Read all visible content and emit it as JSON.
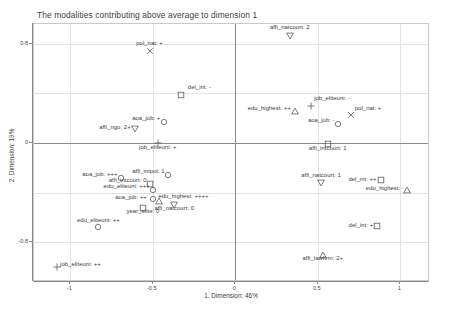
{
  "chart_data": {
    "type": "scatter",
    "title": "The modalities contributing above average to dimension 1",
    "xlabel": "1. Dimension: 46%",
    "ylabel": "2. Dimension: 19%",
    "xlim": [
      -1.22,
      1.18
    ],
    "ylim": [
      -1.12,
      0.96
    ],
    "xticks": [
      -1,
      -0.5,
      0,
      0.5,
      1
    ],
    "xticklabels": [
      "-1",
      "-0.5",
      "0",
      "0.5",
      "1"
    ],
    "yticks": [
      0.8,
      0,
      -0.8
    ],
    "yticklabels": [
      "0.8",
      "0",
      "-0.8"
    ],
    "grid": true,
    "legend": "none",
    "origin_axes": true,
    "points": [
      {
        "label": "affi_natcourt: 2",
        "x": 0.33,
        "y": 0.86,
        "marker": "triangle-down",
        "lx": 0,
        "ly": -6,
        "anchor": "center"
      },
      {
        "label": "pol_nat: +",
        "x": -0.52,
        "y": 0.74,
        "marker": "x",
        "lx": 0,
        "ly": -5,
        "anchor": "center"
      },
      {
        "label": "del_int: -",
        "x": -0.33,
        "y": 0.39,
        "marker": "square",
        "lx": 7,
        "ly": -5,
        "anchor": "start"
      },
      {
        "label": "job_eliteuni: -",
        "x": 0.46,
        "y": 0.3,
        "marker": "plus",
        "lx": 3,
        "ly": -5,
        "anchor": "start"
      },
      {
        "label": "edu_highest: ++",
        "x": 0.36,
        "y": 0.26,
        "marker": "triangle-up",
        "lx": -4,
        "ly": 0,
        "anchor": "end"
      },
      {
        "label": "pol_nat: +",
        "x": 0.7,
        "y": 0.23,
        "marker": "x",
        "lx": 4,
        "ly": -4,
        "anchor": "start"
      },
      {
        "label": "aoa_job: -",
        "x": 0.62,
        "y": 0.15,
        "marker": "circle",
        "lx": -3,
        "ly": -1,
        "anchor": "end"
      },
      {
        "label": "aoa_job: +",
        "x": -0.43,
        "y": 0.17,
        "marker": "circle",
        "lx": -4,
        "ly": -1,
        "anchor": "end"
      },
      {
        "label": "affi_ngo: 2+",
        "x": -0.61,
        "y": 0.11,
        "marker": "triangle-down",
        "lx": -4,
        "ly": 1,
        "anchor": "end"
      },
      {
        "label": "job_eliteuni: +",
        "x": -0.47,
        "y": 0.0,
        "marker": "plus",
        "lx": 0,
        "ly": 7,
        "anchor": "center"
      },
      {
        "label": "affi_intcourt: 1",
        "x": 0.56,
        "y": -0.01,
        "marker": "square",
        "lx": 0,
        "ly": 7,
        "anchor": "center"
      },
      {
        "label": "aoa_job: +++",
        "x": -0.69,
        "y": -0.28,
        "marker": "circle",
        "lx": -4,
        "ly": -1,
        "anchor": "end"
      },
      {
        "label": "affi_intpol: 1",
        "x": -0.41,
        "y": -0.26,
        "marker": "circle",
        "lx": -3,
        "ly": -1,
        "anchor": "end"
      },
      {
        "label": "affi_intcourt: 0",
        "x": -0.52,
        "y": -0.33,
        "marker": "square",
        "lx": -3,
        "ly": -1,
        "anchor": "end"
      },
      {
        "label": "affi_natcourt: 1",
        "x": 0.52,
        "y": -0.32,
        "marker": "triangle-down",
        "lx": 0,
        "ly": -5,
        "anchor": "center"
      },
      {
        "label": "del_int: ++",
        "x": 0.88,
        "y": -0.3,
        "marker": "square",
        "lx": -4,
        "ly": 2,
        "anchor": "end"
      },
      {
        "label": "edu_highest: -",
        "x": 1.04,
        "y": -0.38,
        "marker": "triangle-up",
        "lx": -3,
        "ly": 1,
        "anchor": "end"
      },
      {
        "label": "edu_eliteuni: +++",
        "x": -0.5,
        "y": -0.38,
        "marker": "circle",
        "lx": -3,
        "ly": -1,
        "anchor": "end"
      },
      {
        "label": "aoa_job: ++",
        "x": -0.5,
        "y": -0.45,
        "marker": "circle",
        "lx": -6,
        "ly": 1,
        "anchor": "end"
      },
      {
        "label": "edu_highest: ++++",
        "x": -0.46,
        "y": -0.47,
        "marker": "triangle-up",
        "lx": -1,
        "ly": -2,
        "anchor": "start"
      },
      {
        "label": "year_elite: 0",
        "x": -0.56,
        "y": -0.52,
        "marker": "square",
        "lx": 0,
        "ly": 6,
        "anchor": "center"
      },
      {
        "label": "affi_natcourt: 0",
        "x": -0.37,
        "y": -0.5,
        "marker": "triangle-down",
        "lx": 0,
        "ly": 6,
        "anchor": "center"
      },
      {
        "label": "edu_eliteuni: ++",
        "x": -0.83,
        "y": -0.68,
        "marker": "circle",
        "lx": 0,
        "ly": -4,
        "anchor": "center"
      },
      {
        "label": "del_int: +",
        "x": 0.86,
        "y": -0.67,
        "marker": "square",
        "lx": -4,
        "ly": 2,
        "anchor": "end"
      },
      {
        "label": "affi_lawfirm: 2+",
        "x": 0.53,
        "y": -0.9,
        "marker": "triangle-up",
        "lx": 0,
        "ly": 6,
        "anchor": "center"
      },
      {
        "label": "job_eliteuni: ++",
        "x": -1.08,
        "y": -1.0,
        "marker": "plus",
        "lx": 3,
        "ly": 0,
        "anchor": "start"
      }
    ]
  }
}
